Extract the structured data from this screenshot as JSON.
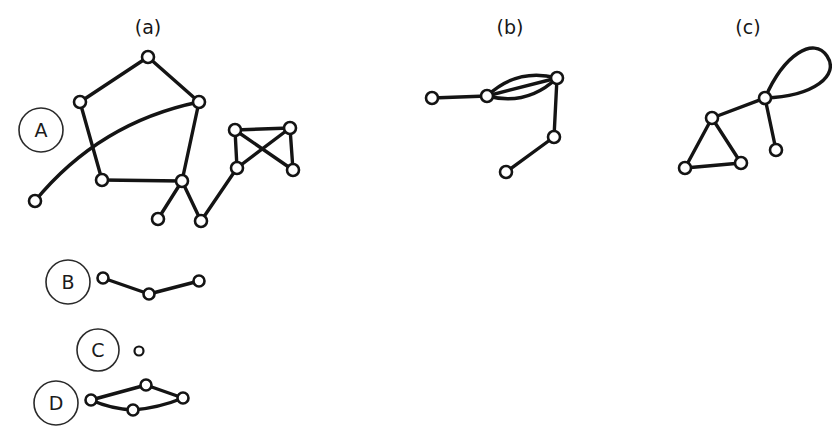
{
  "figure": {
    "width": 832,
    "height": 440,
    "background": "#ffffff",
    "ink_color": "#141414",
    "node_fill": "#ffffff"
  },
  "panel_labels": [
    {
      "id": "a",
      "text": "(a)",
      "x": 148,
      "y": 34
    },
    {
      "id": "b",
      "text": "(b)",
      "x": 510,
      "y": 34
    },
    {
      "id": "c",
      "text": "(c)",
      "x": 748,
      "y": 34
    }
  ],
  "row_labels": [
    {
      "id": "A",
      "text": "A",
      "cx": 41,
      "cy": 130,
      "r": 22
    },
    {
      "id": "B",
      "text": "B",
      "cx": 68,
      "cy": 282,
      "r": 22
    },
    {
      "id": "C",
      "text": "C",
      "cx": 98,
      "cy": 350,
      "r": 21
    },
    {
      "id": "D",
      "text": "D",
      "cx": 56,
      "cy": 403,
      "r": 22
    }
  ],
  "graphs": [
    {
      "id": "A-a",
      "row": "A",
      "panel": "a",
      "description": "pentagon with curved chord, pendant vertices and a four-node crossed quadrilateral",
      "nodes": [
        {
          "id": "a1",
          "x": 148,
          "y": 57,
          "r": 6
        },
        {
          "id": "a2",
          "x": 80,
          "y": 102,
          "r": 6
        },
        {
          "id": "a3",
          "x": 199,
          "y": 102,
          "r": 6
        },
        {
          "id": "a4",
          "x": 102,
          "y": 180,
          "r": 6
        },
        {
          "id": "a5",
          "x": 182,
          "y": 181,
          "r": 6
        },
        {
          "id": "a6",
          "x": 35,
          "y": 201,
          "r": 6
        },
        {
          "id": "a7",
          "x": 158,
          "y": 219,
          "r": 6
        },
        {
          "id": "a8",
          "x": 201,
          "y": 221,
          "r": 6
        },
        {
          "id": "a9",
          "x": 235,
          "y": 130,
          "r": 6
        },
        {
          "id": "a10",
          "x": 290,
          "y": 128,
          "r": 6
        },
        {
          "id": "a11",
          "x": 237,
          "y": 168,
          "r": 6
        },
        {
          "id": "a12",
          "x": 293,
          "y": 170,
          "r": 6
        }
      ],
      "edges": [
        {
          "from": "a2",
          "to": "a1",
          "type": "line"
        },
        {
          "from": "a1",
          "to": "a3",
          "type": "line"
        },
        {
          "from": "a2",
          "to": "a4",
          "type": "line"
        },
        {
          "from": "a3",
          "to": "a5",
          "type": "line"
        },
        {
          "from": "a4",
          "to": "a5",
          "type": "line"
        },
        {
          "from": "a6",
          "to": "a3",
          "type": "curve",
          "curvature": -34
        },
        {
          "from": "a5",
          "to": "a7",
          "type": "line"
        },
        {
          "from": "a5",
          "to": "a8",
          "type": "line"
        },
        {
          "from": "a8",
          "to": "a11",
          "type": "line"
        },
        {
          "from": "a9",
          "to": "a10",
          "type": "line"
        },
        {
          "from": "a9",
          "to": "a11",
          "type": "line"
        },
        {
          "from": "a9",
          "to": "a12",
          "type": "line"
        },
        {
          "from": "a10",
          "to": "a11",
          "type": "line"
        },
        {
          "from": "a10",
          "to": "a12",
          "type": "line"
        }
      ]
    },
    {
      "id": "A-b",
      "row": "A",
      "panel": "b",
      "description": "multigraph with three parallel edges, a pendant vertex and a two-edge tail",
      "nodes": [
        {
          "id": "b1",
          "x": 432,
          "y": 98,
          "r": 6
        },
        {
          "id": "b2",
          "x": 487,
          "y": 96,
          "r": 6
        },
        {
          "id": "b3",
          "x": 557,
          "y": 78,
          "r": 6
        },
        {
          "id": "b4",
          "x": 554,
          "y": 137,
          "r": 6
        },
        {
          "id": "b5",
          "x": 506,
          "y": 172,
          "r": 6
        }
      ],
      "edges": [
        {
          "from": "b1",
          "to": "b2",
          "type": "line"
        },
        {
          "from": "b2",
          "to": "b3",
          "type": "curve",
          "curvature": -20
        },
        {
          "from": "b2",
          "to": "b3",
          "type": "curve",
          "curvature": 0
        },
        {
          "from": "b2",
          "to": "b3",
          "type": "curve",
          "curvature": 20
        },
        {
          "from": "b3",
          "to": "b4",
          "type": "line"
        },
        {
          "from": "b4",
          "to": "b5",
          "type": "line"
        }
      ]
    },
    {
      "id": "A-c",
      "row": "A",
      "panel": "c",
      "description": "triangle joined to a vertex carrying a self-loop and a pendant vertex",
      "nodes": [
        {
          "id": "c1",
          "x": 765,
          "y": 98,
          "r": 6
        },
        {
          "id": "c2",
          "x": 712,
          "y": 118,
          "r": 6
        },
        {
          "id": "c3",
          "x": 685,
          "y": 168,
          "r": 6
        },
        {
          "id": "c4",
          "x": 741,
          "y": 163,
          "r": 6
        },
        {
          "id": "c5",
          "x": 776,
          "y": 150,
          "r": 6
        }
      ],
      "edges": [
        {
          "from": "c1",
          "to": "c2",
          "type": "line"
        },
        {
          "from": "c2",
          "to": "c3",
          "type": "line"
        },
        {
          "from": "c2",
          "to": "c4",
          "type": "line"
        },
        {
          "from": "c3",
          "to": "c4",
          "type": "line"
        },
        {
          "from": "c1",
          "to": "c5",
          "type": "line"
        },
        {
          "from": "c1",
          "to": "c1",
          "type": "selfloop",
          "dx": 62,
          "dy": -42,
          "spread": 26
        }
      ]
    },
    {
      "id": "B-path",
      "row": "B",
      "panel": "a",
      "description": "path on three vertices",
      "nodes": [
        {
          "id": "p1",
          "x": 103,
          "y": 278,
          "r": 5.5
        },
        {
          "id": "p2",
          "x": 149,
          "y": 294,
          "r": 5.5
        },
        {
          "id": "p3",
          "x": 199,
          "y": 281,
          "r": 5.5
        }
      ],
      "edges": [
        {
          "from": "p1",
          "to": "p2",
          "type": "line"
        },
        {
          "from": "p2",
          "to": "p3",
          "type": "line"
        }
      ]
    },
    {
      "id": "C-isolated",
      "row": "C",
      "panel": "a",
      "description": "single isolated vertex",
      "nodes": [
        {
          "id": "s1",
          "x": 139,
          "y": 351,
          "r": 4.5
        }
      ],
      "edges": []
    },
    {
      "id": "D-cycle",
      "row": "D",
      "panel": "a",
      "description": "four-vertex cycle drawn as a lens with curved sides",
      "nodes": [
        {
          "id": "d1",
          "x": 91,
          "y": 400,
          "r": 5.5
        },
        {
          "id": "d2",
          "x": 146,
          "y": 385,
          "r": 5.5
        },
        {
          "id": "d3",
          "x": 183,
          "y": 398,
          "r": 5.5
        },
        {
          "id": "d4",
          "x": 133,
          "y": 410,
          "r": 5.5
        }
      ],
      "edges": [
        {
          "from": "d1",
          "to": "d2",
          "type": "line"
        },
        {
          "from": "d2",
          "to": "d3",
          "type": "line"
        },
        {
          "from": "d1",
          "to": "d4",
          "type": "curve",
          "curvature": 4
        },
        {
          "from": "d4",
          "to": "d3",
          "type": "curve",
          "curvature": 4
        }
      ]
    }
  ]
}
